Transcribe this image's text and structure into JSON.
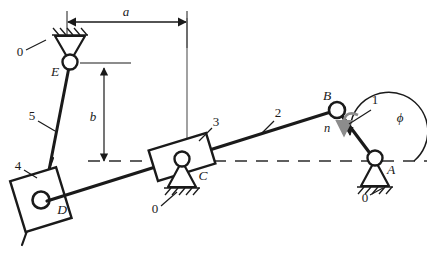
{
  "figure": {
    "kind": "kinematic-linkage-diagram",
    "background_color": "#ffffff",
    "line_color": "#1a1a1a",
    "accent_color": "#8c8c8c",
    "width": 427,
    "height": 265
  },
  "joints": {
    "A": {
      "label": "A",
      "x": 375,
      "y": 160,
      "type": "fixed-pivot",
      "ground_label": "0"
    },
    "B": {
      "label": "B",
      "x": 337,
      "y": 110,
      "type": "pin-joint"
    },
    "C": {
      "label": "C",
      "x": 182,
      "y": 161,
      "type": "fixed-pivot",
      "ground_label": "0"
    },
    "D": {
      "label": "D",
      "x": 41,
      "y": 200,
      "type": "slider-pin"
    },
    "E": {
      "label": "E",
      "x": 70,
      "y": 62,
      "type": "fixed-pivot",
      "ground_label": "0"
    }
  },
  "links": [
    {
      "number": "1",
      "name": "crank-AB",
      "from": "A",
      "to": "B"
    },
    {
      "number": "2",
      "name": "coupler-BC",
      "from": "B",
      "to": "C"
    },
    {
      "number": "3",
      "name": "rocker-block-C",
      "from": "C",
      "to": "C"
    },
    {
      "number": "4",
      "name": "slider-block-D",
      "from": "D",
      "to": "D"
    },
    {
      "number": "5",
      "name": "link-ED",
      "from": "E",
      "to": "D"
    }
  ],
  "dimensions": {
    "a": {
      "label": "a",
      "orientation": "horizontal",
      "from_x": 67,
      "to_x": 187,
      "y": 22
    },
    "b": {
      "label": "b",
      "orientation": "vertical",
      "x": 104,
      "from_y": 68,
      "to_y": 162
    }
  },
  "annotations": {
    "angle": {
      "label": "ϕ",
      "name": "phi-angle",
      "at_joint": "A"
    },
    "force": {
      "label": "n",
      "name": "n-arrow",
      "direction": "downward",
      "at_joint": "B"
    },
    "centerline": {
      "name": "horizontal-centerline",
      "y": 161,
      "from_x": 88,
      "to_x": 427,
      "style": "dashed"
    }
  },
  "ground_labels": [
    {
      "label": "0",
      "x": 22,
      "y": 53,
      "name": "ground-label-E"
    },
    {
      "label": "0",
      "x": 156,
      "y": 210,
      "name": "ground-label-C"
    },
    {
      "label": "0",
      "x": 365,
      "y": 199,
      "name": "ground-label-A"
    }
  ],
  "link_number_labels": [
    {
      "label": "1",
      "x": 375,
      "y": 104,
      "name": "link-label-1"
    },
    {
      "label": "2",
      "x": 278,
      "y": 115,
      "name": "link-label-2"
    },
    {
      "label": "3",
      "x": 215,
      "y": 124,
      "name": "link-label-3"
    },
    {
      "label": "4",
      "x": 18,
      "y": 166,
      "name": "link-label-4"
    },
    {
      "label": "5",
      "x": 32,
      "y": 117,
      "name": "link-label-5"
    }
  ]
}
